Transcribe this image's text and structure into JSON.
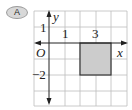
{
  "badge": {
    "label": "A"
  },
  "diagram": {
    "type": "coordinate-grid",
    "axes": {
      "x_label": "x",
      "y_label": "y",
      "origin_label": "O"
    },
    "tick_labels": {
      "x_1": "1",
      "x_3": "3",
      "y_1": "1",
      "y_neg2": "−2"
    },
    "grid": {
      "x_range": [
        -1,
        5
      ],
      "y_range": [
        -4,
        2
      ],
      "step": 1
    },
    "shaded_rectangle": {
      "x_min": 2,
      "x_max": 4,
      "y_min": -2,
      "y_max": 0,
      "fill": "#cccccc",
      "stroke": "#333333"
    },
    "colors": {
      "grid": "#bdbdbd",
      "axis": "#222222"
    }
  }
}
